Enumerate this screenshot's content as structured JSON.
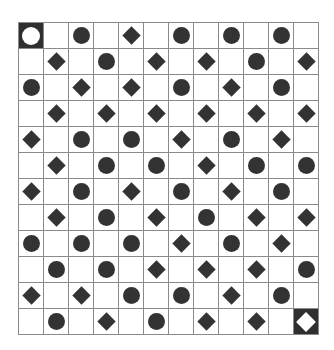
{
  "board": {
    "rows": 12,
    "cols": 12,
    "colors": {
      "piece": "#333333",
      "special_bg": "#2f2f2f",
      "special_piece": "#ffffff",
      "grid_line": "#8a8a8a",
      "background": "#ffffff"
    },
    "legend": {
      "C": "circle",
      "D": "diamond",
      ".": "empty",
      "S": "start-circle-highlighted",
      "E": "end-diamond-highlighted"
    },
    "grid": [
      "S.C.D.C.C.C.",
      ".D.C.D.D.C.D",
      "C.D.D.C.D.C.",
      ".D.D.D.D.D.D",
      "D.C.C.D.C.D.",
      ".D.C.C.D.C.C",
      "D.C.D.C.D.C.",
      ".D.C.D.C.D.D",
      "C.C.C.D.C.D.",
      ".C.C.D.D.D.C",
      "D.D.C.C.D.C.",
      ".C.D.C.D.D.E"
    ]
  }
}
